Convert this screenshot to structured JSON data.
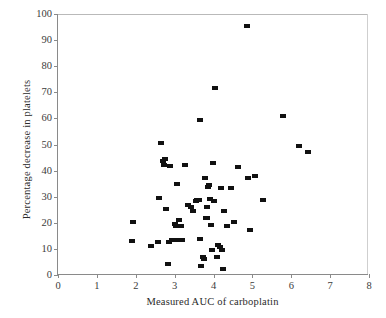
{
  "chart_data": {
    "type": "scatter",
    "title": "",
    "xlabel": "Measured AUC of carboplatin",
    "ylabel": "Percentage decrease in platelets",
    "xlim": [
      0,
      8
    ],
    "ylim": [
      0,
      100
    ],
    "xticks": [
      0,
      1,
      2,
      3,
      4,
      5,
      6,
      7,
      8
    ],
    "yticks": [
      0,
      10,
      20,
      30,
      40,
      50,
      60,
      70,
      80,
      90,
      100
    ],
    "grid": false,
    "legend": null,
    "marker": "square",
    "marker_color": "#111111",
    "series": [
      {
        "name": "patients",
        "points": [
          [
            1.92,
            20.2
          ],
          [
            1.9,
            12.9
          ],
          [
            2.38,
            11.2
          ],
          [
            2.57,
            12.8
          ],
          [
            2.61,
            29.6
          ],
          [
            2.66,
            50.7
          ],
          [
            2.7,
            43.8
          ],
          [
            2.72,
            42.0
          ],
          [
            2.74,
            44.6
          ],
          [
            2.78,
            25.2
          ],
          [
            2.82,
            4.2
          ],
          [
            2.86,
            12.5
          ],
          [
            2.88,
            41.6
          ],
          [
            2.92,
            13.5
          ],
          [
            3.02,
            19.5
          ],
          [
            3.04,
            18.6
          ],
          [
            3.06,
            35.0
          ],
          [
            3.08,
            13.4
          ],
          [
            3.12,
            21.0
          ],
          [
            3.16,
            18.8
          ],
          [
            3.2,
            13.5
          ],
          [
            3.26,
            42.2
          ],
          [
            3.34,
            26.8
          ],
          [
            3.42,
            26.0
          ],
          [
            3.46,
            24.6
          ],
          [
            3.54,
            28.4
          ],
          [
            3.58,
            28.6
          ],
          [
            3.62,
            28.8
          ],
          [
            3.64,
            13.8
          ],
          [
            3.66,
            59.2
          ],
          [
            3.68,
            3.6
          ],
          [
            3.72,
            7.0
          ],
          [
            3.74,
            6.8
          ],
          [
            3.76,
            6.2
          ],
          [
            3.78,
            37.2
          ],
          [
            3.8,
            21.8
          ],
          [
            3.82,
            26.2
          ],
          [
            3.84,
            22.0
          ],
          [
            3.86,
            33.8
          ],
          [
            3.88,
            34.6
          ],
          [
            3.92,
            29.0
          ],
          [
            3.94,
            19.0
          ],
          [
            3.96,
            9.6
          ],
          [
            3.98,
            43.0
          ],
          [
            4.02,
            28.2
          ],
          [
            4.04,
            71.5
          ],
          [
            4.08,
            7.0
          ],
          [
            4.12,
            11.6
          ],
          [
            4.16,
            10.8
          ],
          [
            4.2,
            33.2
          ],
          [
            4.22,
            9.6
          ],
          [
            4.24,
            2.2
          ],
          [
            4.28,
            24.6
          ],
          [
            4.34,
            18.6
          ],
          [
            4.46,
            33.4
          ],
          [
            4.54,
            20.2
          ],
          [
            4.62,
            41.4
          ],
          [
            4.86,
            95.4
          ],
          [
            4.9,
            37.0
          ],
          [
            4.94,
            17.2
          ],
          [
            5.06,
            37.8
          ],
          [
            5.28,
            28.6
          ],
          [
            5.8,
            61.0
          ],
          [
            6.2,
            49.3
          ],
          [
            6.42,
            47.2
          ]
        ]
      }
    ]
  }
}
